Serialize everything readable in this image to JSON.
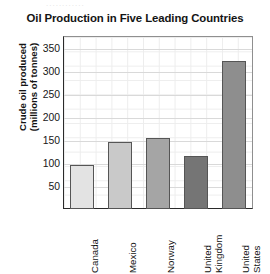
{
  "top_remnant": "............",
  "chart_data": {
    "type": "bar",
    "title": "Oil Production in Five Leading Countries",
    "xlabel": "",
    "ylabel": "Crude oil produced (millions of tonnes)",
    "ylabel_lines": [
      "Crude oil produced",
      "(millions of tonnes)"
    ],
    "categories": [
      "Canada",
      "Mexico",
      "Norway",
      "United Kingdom",
      "United States"
    ],
    "category_lines": [
      [
        "Canada"
      ],
      [
        "Mexico"
      ],
      [
        "Norway"
      ],
      [
        "United",
        "Kingdom"
      ],
      [
        "United",
        "States"
      ]
    ],
    "values": [
      95,
      145,
      155,
      115,
      320
    ],
    "bar_colors": [
      "#e3e3e3",
      "#c9c9c9",
      "#a5a5a5",
      "#757575",
      "#8e8e8e"
    ],
    "ylim": [
      0,
      375
    ],
    "yticks": [
      50,
      100,
      150,
      200,
      250,
      300,
      350
    ],
    "ytick_labels": [
      "50",
      "100",
      "150",
      "200",
      "250",
      "300",
      "350"
    ],
    "grid": true,
    "minor_grid": true,
    "legend": "none",
    "legend_position": "none"
  }
}
